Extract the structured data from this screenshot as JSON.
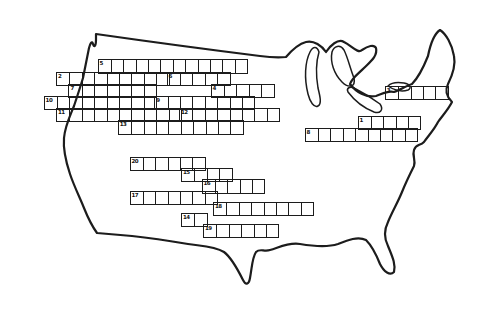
{
  "colors": {
    "ink": "#1c1c1c",
    "paper": "#ffffff"
  },
  "grid": {
    "cell_w": 12.4,
    "cell_h": 12.2,
    "words": [
      {
        "number": "5",
        "x": 97.5,
        "y": 59.4,
        "cells": 12
      },
      {
        "number": "2",
        "x": 56.0,
        "y": 71.6,
        "cells": 9
      },
      {
        "number": "6",
        "x": 166.6,
        "y": 71.6,
        "cells": 5
      },
      {
        "number": "7",
        "x": 68.4,
        "y": 83.8,
        "cells": 7
      },
      {
        "number": "4",
        "x": 210.6,
        "y": 83.8,
        "cells": 5
      },
      {
        "number": "10",
        "x": 43.6,
        "y": 96.0,
        "cells": 9
      },
      {
        "number": "9",
        "x": 154.2,
        "y": 96.0,
        "cells": 8
      },
      {
        "number": "11",
        "x": 56.0,
        "y": 108.2,
        "cells": 10
      },
      {
        "number": "12",
        "x": 179.0,
        "y": 108.2,
        "cells": 8
      },
      {
        "number": "13",
        "x": 117.8,
        "y": 120.4,
        "cells": 10
      },
      {
        "number": "3",
        "x": 384.8,
        "y": 85.5,
        "cells": 5
      },
      {
        "number": "1",
        "x": 357.5,
        "y": 115.5,
        "cells": 5
      },
      {
        "number": "8",
        "x": 304.6,
        "y": 127.7,
        "cells": 9
      },
      {
        "number": "20",
        "x": 129.5,
        "y": 157.0,
        "cells": 6
      },
      {
        "number": "15",
        "x": 181.0,
        "y": 168.2,
        "cells": 4
      },
      {
        "number": "16",
        "x": 201.5,
        "y": 179.4,
        "cells": 5
      },
      {
        "number": "17",
        "x": 129.5,
        "y": 190.6,
        "cells": 7
      },
      {
        "number": "18",
        "x": 213.0,
        "y": 201.8,
        "cells": 8
      },
      {
        "number": "14",
        "x": 181.0,
        "y": 213.0,
        "cells": 2
      },
      {
        "number": "19",
        "x": 203.0,
        "y": 224.2,
        "cells": 6
      }
    ]
  }
}
